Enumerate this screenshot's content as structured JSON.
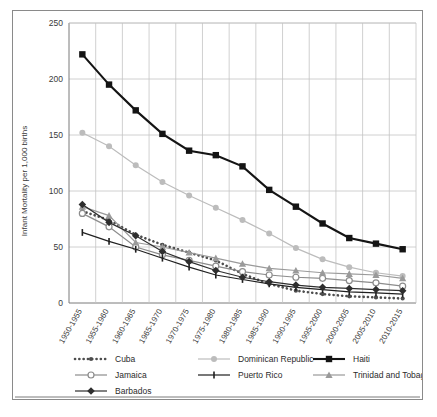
{
  "chart_data": {
    "type": "line",
    "title": "",
    "xlabel": "",
    "ylabel": "Infant Mortality per 1,000 births",
    "ylim": [
      0,
      250
    ],
    "yticks": [
      0,
      50,
      100,
      150,
      200,
      250
    ],
    "grid": true,
    "legend_position": "bottom",
    "categories": [
      "1950-1955",
      "1955-1960",
      "1960-1965",
      "1965-1970",
      "1970-1975",
      "1975-1980",
      "1980-1985",
      "1985-1990",
      "1990-1995",
      "1995-2000",
      "2000-2005",
      "2005-2010",
      "2010-2015"
    ],
    "series": [
      {
        "name": "Cuba",
        "color": "#4d4d4d",
        "marker": "dot",
        "line": "dotted",
        "values": [
          82,
          74,
          61,
          52,
          45,
          38,
          26,
          17,
          11,
          8,
          6,
          5,
          4
        ]
      },
      {
        "name": "Dominican Republic",
        "color": "#bcbcbc",
        "marker": "circle",
        "line": "solid",
        "values": [
          152,
          140,
          123,
          108,
          96,
          85,
          74,
          62,
          49,
          39,
          32,
          27,
          24
        ]
      },
      {
        "name": "Haiti",
        "color": "#141414",
        "marker": "square",
        "line": "solid",
        "values": [
          222,
          195,
          172,
          151,
          136,
          132,
          122,
          101,
          86,
          71,
          58,
          53,
          48
        ]
      },
      {
        "name": "Jamaica",
        "color": "#8c8c8c",
        "marker": "open-circle",
        "line": "solid",
        "values": [
          80,
          68,
          50,
          43,
          38,
          33,
          28,
          25,
          23,
          22,
          20,
          18,
          15
        ]
      },
      {
        "name": "Puerto Rico",
        "color": "#1f1f1f",
        "marker": "plus",
        "line": "solid",
        "values": [
          63,
          55,
          48,
          40,
          32,
          25,
          21,
          17,
          14,
          12,
          10,
          9,
          8
        ]
      },
      {
        "name": "Trinidad and Tobago",
        "color": "#9a9a9a",
        "marker": "triangle",
        "line": "solid",
        "values": [
          86,
          78,
          54,
          50,
          45,
          40,
          35,
          31,
          29,
          27,
          26,
          25,
          22
        ]
      },
      {
        "name": "Barbados",
        "color": "#2e2e2e",
        "marker": "diamond",
        "line": "solid",
        "values": [
          88,
          72,
          60,
          46,
          37,
          29,
          23,
          19,
          16,
          14,
          13,
          12,
          11
        ]
      }
    ]
  },
  "legend": {
    "items": [
      "Cuba",
      "Dominican Republic",
      "Haiti",
      "Jamaica",
      "Puerto Rico",
      "Trinidad and Tobago",
      "Barbados"
    ]
  }
}
